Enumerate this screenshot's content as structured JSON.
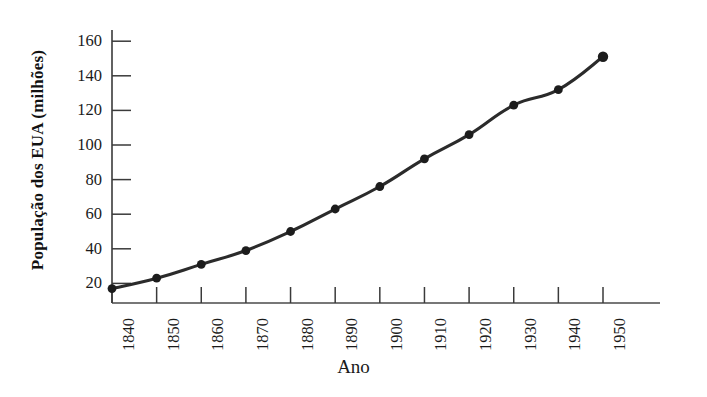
{
  "chart_data": {
    "type": "line",
    "title": "",
    "xlabel": "Ano",
    "ylabel": "População dos EUA (milhões)",
    "categories": [
      "1840",
      "1850",
      "1860",
      "1870",
      "1880",
      "1890",
      "1900",
      "1910",
      "1920",
      "1930",
      "1940",
      "1950"
    ],
    "x": [
      1840,
      1850,
      1860,
      1870,
      1880,
      1890,
      1900,
      1910,
      1920,
      1930,
      1940,
      1950
    ],
    "values": [
      17,
      23,
      31,
      39,
      50,
      63,
      76,
      92,
      106,
      123,
      132,
      151
    ],
    "series": [
      {
        "name": "População dos EUA",
        "values": [
          17,
          23,
          31,
          39,
          50,
          63,
          76,
          92,
          106,
          123,
          132,
          151
        ]
      }
    ],
    "ytick_labels": [
      "20",
      "40",
      "60",
      "80",
      "100",
      "120",
      "140",
      "160"
    ],
    "ytick_values": [
      20,
      40,
      60,
      80,
      100,
      120,
      140,
      160
    ],
    "xlim": [
      1840,
      1950
    ],
    "ylim": [
      0,
      172
    ],
    "grid": false,
    "legend": "none",
    "marker": "filled-circle",
    "line_color": "#2b2b2b",
    "marker_color": "#1c1c1c",
    "axis_color": "#3a3a3a",
    "background_color": "#ffffff"
  },
  "axes": {
    "y_axis_name": "y-axis",
    "x_axis_name": "x-axis"
  }
}
